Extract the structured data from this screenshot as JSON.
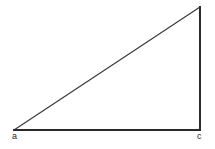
{
  "figure": {
    "type": "right-triangle",
    "background_color": "#ffffff",
    "canvas": {
      "width": 215,
      "height": 149
    },
    "stroke_color_primary": "#2a2a2a",
    "stroke_color_hypotenuse": "#3a3a3a",
    "stroke_width_primary": 2,
    "stroke_width_hypotenuse": 1.2,
    "fill": "none",
    "vertices": [
      {
        "id": "a",
        "label": "a",
        "x": 14,
        "y": 130,
        "labeled": true,
        "label_position": "below-left"
      },
      {
        "id": "apex",
        "label": "",
        "x": 200,
        "y": 7,
        "labeled": false,
        "label_position": "none"
      },
      {
        "id": "c",
        "label": "c",
        "x": 200,
        "y": 130,
        "labeled": true,
        "label_position": "below-right"
      }
    ],
    "edges": [
      {
        "id": "base",
        "from": "a",
        "to": "c",
        "orientation": "horizontal"
      },
      {
        "id": "vertical-leg",
        "from": "c",
        "to": "apex",
        "orientation": "vertical"
      },
      {
        "id": "hypotenuse",
        "from": "a",
        "to": "apex",
        "orientation": "diagonal"
      }
    ],
    "right_angle_at": "c"
  },
  "labels": {
    "a": "a",
    "c": "c"
  }
}
